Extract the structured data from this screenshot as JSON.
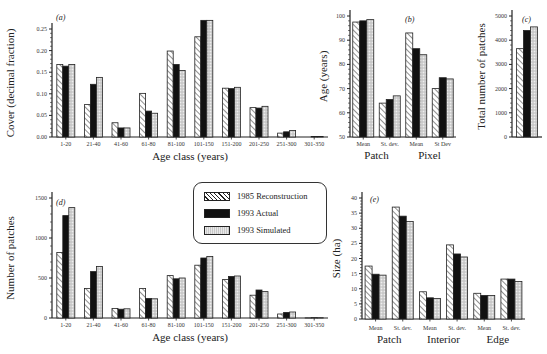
{
  "legend": {
    "items": [
      {
        "label": "1985 Reconstruction",
        "pattern": "hatch"
      },
      {
        "label": "1993 Actual",
        "pattern": "solid-black"
      },
      {
        "label": "1993 Simulated",
        "pattern": "stipple"
      }
    ]
  },
  "colors": {
    "hatch": "#ffffff",
    "actual": "#111111",
    "simulated": "#d9d9d9",
    "axis": "#222222"
  },
  "chart_data": [
    {
      "panel": "(a)",
      "type": "bar",
      "xlabel": "Age class (years)",
      "ylabel": "Cover (decimal fraction)",
      "ylim": [
        0,
        0.27
      ],
      "yticks": [
        "0.00",
        "0.05",
        "0.10",
        "0.15",
        "0.20",
        "0.25"
      ],
      "categories": [
        "1-20",
        "21-40",
        "41-60",
        "61-80",
        "81-100",
        "101-150",
        "151-200",
        "201-250",
        "251-300",
        "301-350"
      ],
      "series": [
        {
          "name": "1985 Reconstruction",
          "values": [
            0.168,
            0.075,
            0.033,
            0.101,
            0.199,
            0.232,
            0.113,
            0.068,
            0.009,
            0.0
          ]
        },
        {
          "name": "1993 Actual",
          "values": [
            0.164,
            0.122,
            0.021,
            0.06,
            0.168,
            0.27,
            0.112,
            0.067,
            0.012,
            0.001
          ]
        },
        {
          "name": "1993 Simulated",
          "values": [
            0.168,
            0.138,
            0.021,
            0.055,
            0.154,
            0.27,
            0.115,
            0.071,
            0.015,
            0.001
          ]
        }
      ]
    },
    {
      "panel": "(b)",
      "type": "bar",
      "xlabel": "",
      "ylabel": "Age (years)",
      "ylim": [
        50,
        100
      ],
      "yticks": [
        "50",
        "60",
        "70",
        "80",
        "90",
        "100"
      ],
      "groups": [
        "Patch",
        "Pixel"
      ],
      "categories": [
        "Mean",
        "St. dev.",
        "Mean",
        "St Dev"
      ],
      "series": [
        {
          "name": "1985 Reconstruction",
          "values": [
            97.5,
            64,
            93,
            70
          ]
        },
        {
          "name": "1993 Actual",
          "values": [
            98,
            65.5,
            86.5,
            74.5
          ]
        },
        {
          "name": "1993 Simulated",
          "values": [
            98.5,
            67,
            84,
            74
          ]
        }
      ]
    },
    {
      "panel": "(c)",
      "type": "bar",
      "xlabel": "",
      "ylabel": "Total number of patches",
      "ylim": [
        0,
        5000
      ],
      "yticks": [
        "0",
        "1000",
        "2000",
        "3000",
        "4000",
        "5000"
      ],
      "categories": [
        ""
      ],
      "series": [
        {
          "name": "1985 Reconstruction",
          "values": [
            3650
          ]
        },
        {
          "name": "1993 Actual",
          "values": [
            4400
          ]
        },
        {
          "name": "1993 Simulated",
          "values": [
            4550
          ]
        }
      ]
    },
    {
      "panel": "(d)",
      "type": "bar",
      "xlabel": "Age class (years)",
      "ylabel": "Number of patches",
      "ylim": [
        0,
        1500
      ],
      "yticks": [
        "0",
        "500",
        "1000",
        "1500"
      ],
      "categories": [
        "1-20",
        "21-40",
        "41-60",
        "61-80",
        "81-100",
        "101-150",
        "151-200",
        "201-250",
        "251-300",
        "301-350"
      ],
      "series": [
        {
          "name": "1985 Reconstruction",
          "values": [
            820,
            370,
            120,
            370,
            530,
            660,
            480,
            285,
            50,
            2
          ]
        },
        {
          "name": "1993 Actual",
          "values": [
            1280,
            580,
            110,
            245,
            490,
            750,
            520,
            350,
            70,
            4
          ]
        },
        {
          "name": "1993 Simulated",
          "values": [
            1380,
            645,
            115,
            240,
            500,
            770,
            525,
            330,
            75,
            4
          ]
        }
      ]
    },
    {
      "panel": "(e)",
      "type": "bar",
      "xlabel": "",
      "ylabel": "Size (ha)",
      "ylim": [
        0,
        40
      ],
      "yticks": [
        "0",
        "5",
        "10",
        "15",
        "20",
        "25",
        "30",
        "35",
        "40"
      ],
      "groups": [
        "Patch",
        "Interior",
        "Edge"
      ],
      "categories": [
        "Mean",
        "St. dev.",
        "Mean",
        "St. dev.",
        "Mean",
        "St. dev."
      ],
      "series": [
        {
          "name": "1985 Reconstruction",
          "values": [
            17.5,
            37,
            9,
            24.5,
            8.5,
            13.2
          ]
        },
        {
          "name": "1993 Actual",
          "values": [
            14.8,
            34,
            7,
            21.5,
            7.8,
            13.2
          ]
        },
        {
          "name": "1993 Simulated",
          "values": [
            14.5,
            32.2,
            6.8,
            20.5,
            7.8,
            12.4
          ]
        }
      ]
    }
  ]
}
